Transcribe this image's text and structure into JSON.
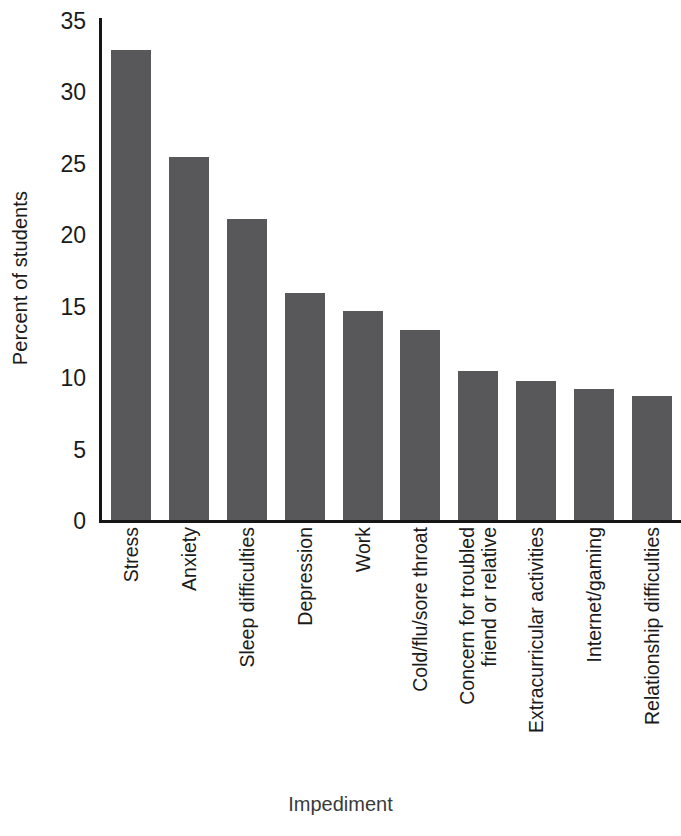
{
  "chart_data": {
    "type": "bar",
    "title": "",
    "xlabel": "Impediment",
    "ylabel": "Percent of students",
    "categories": [
      "Stress",
      "Anxiety",
      "Sleep difficulties",
      "Depression",
      "Work",
      "Cold/flu/sore throat",
      "Concern for troubled\nfriend or relative",
      "Extracurricular activities",
      "Internet/gaming",
      "Relationship difficulties"
    ],
    "values": [
      32.9,
      25.4,
      21.1,
      15.9,
      14.6,
      13.3,
      10.4,
      9.7,
      9.2,
      8.7
    ],
    "ylim": [
      0,
      35
    ],
    "yticks": [
      0,
      5,
      10,
      15,
      20,
      25,
      30,
      35
    ],
    "ytick_labels": [
      "0",
      "5",
      "10",
      "15",
      "20",
      "25",
      "30",
      "35"
    ],
    "grid": false,
    "legend": false,
    "bar_color": "#58585a",
    "axis_color": "#151515",
    "background": "#ffffff"
  }
}
